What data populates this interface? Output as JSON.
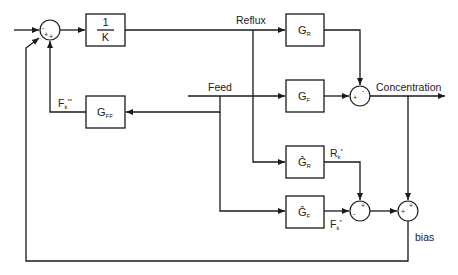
{
  "diagram": {
    "type": "control block diagram",
    "colors": {
      "stroke": "#1a1a1a",
      "text": "#222222",
      "background": "#ffffff"
    },
    "signals": {
      "reflux": "Reflux",
      "feed": "Feed",
      "concentration": "Concentration",
      "bias": "bias",
      "fk_double_star": {
        "base": "F",
        "sub": "k",
        "sup": "**"
      },
      "rk_star": {
        "base": "R",
        "sub": "k",
        "sup": "*"
      },
      "fk_star": {
        "base": "F",
        "sub": "k",
        "sup": "*"
      }
    },
    "blocks": {
      "inverse_k": {
        "numerator": "1",
        "denominator": "K"
      },
      "g_r": {
        "base": "G",
        "sub": "R"
      },
      "g_f": {
        "base": "G",
        "sub": "F"
      },
      "g_ff": {
        "base": "G",
        "sub": "FF"
      },
      "g_r_hat": {
        "base": "Ĝ",
        "sub": "R"
      },
      "g_f_hat": {
        "base": "Ĝ",
        "sub": "F"
      }
    },
    "junctions": {
      "setpoint_sum": {
        "signs": [
          "-",
          "+",
          "+"
        ]
      },
      "process_sum": {
        "signs": [
          "-",
          "+"
        ]
      },
      "model_sum": {
        "signs": [
          "+",
          "-"
        ]
      },
      "bias_sum": {
        "signs": [
          "+",
          "+"
        ]
      }
    }
  }
}
